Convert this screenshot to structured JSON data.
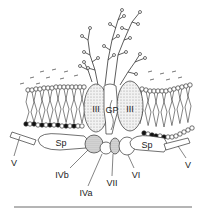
{
  "diagram": {
    "labels": {
      "glycophorin": "GP",
      "band3_left": "III",
      "band3_right": "III",
      "spectrin_left": "Sp",
      "spectrin_right": "Sp",
      "band5_left": "V",
      "band5_right": "V",
      "band4_1b": "IVb",
      "band4_1a": "IVa",
      "band7": "VII",
      "band6": "VI"
    },
    "colors": {
      "line": "#333333",
      "stipple": "#dcdcdc",
      "head_filled": "#111111",
      "head_open": "#ffffff"
    }
  }
}
